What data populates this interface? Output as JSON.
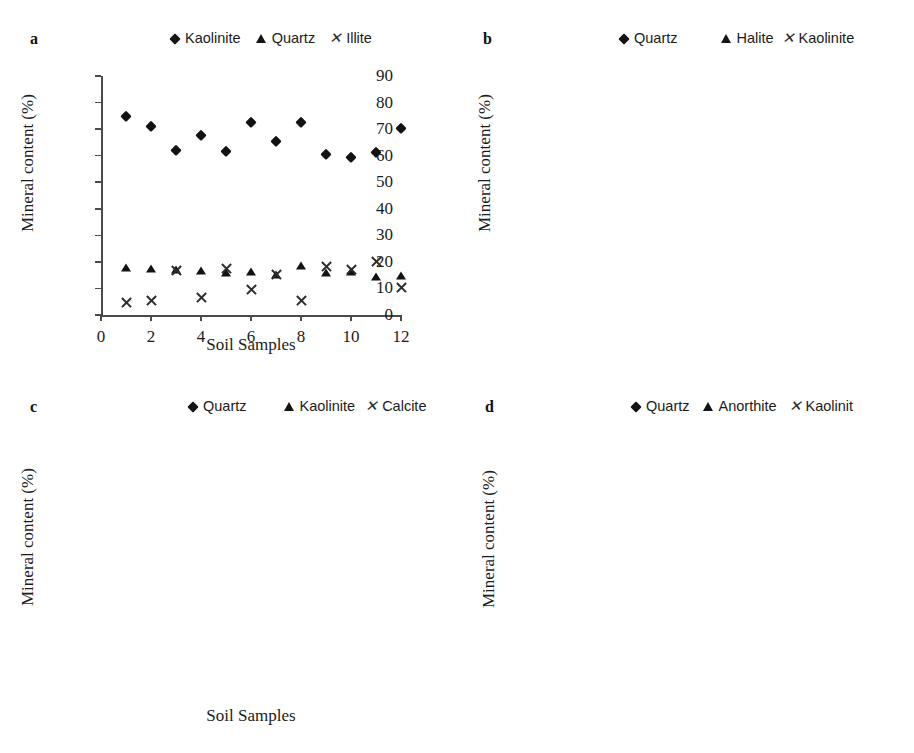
{
  "figure": {
    "axis_title_y": "Mineral content (%)",
    "axis_title_x": "Soil Samples",
    "xticks": [
      "0",
      "2",
      "4",
      "6",
      "8",
      "10",
      "12"
    ]
  },
  "panels": [
    {
      "letter": "a",
      "yticks": [
        "0",
        "10",
        "20",
        "30",
        "40",
        "50",
        "60",
        "70",
        "80",
        "90"
      ],
      "legend": [
        {
          "marker": "diamond-marker",
          "label": "Kaolinite"
        },
        {
          "marker": "triangle-marker",
          "label": "Quartz"
        },
        {
          "marker": "cross-marker",
          "label": "Illite"
        }
      ]
    },
    {
      "letter": "b",
      "yticks": [
        "0",
        "10",
        "20",
        "30",
        "40",
        "50",
        "60",
        "70",
        "80",
        "90"
      ],
      "legend": [
        {
          "marker": "diamond-marker",
          "label": "Quartz"
        },
        {
          "marker": "triangle-marker",
          "label": "Halite"
        },
        {
          "marker": "cross-marker",
          "label": "Kaolinite"
        }
      ]
    },
    {
      "letter": "c",
      "yticks": [
        "0",
        "10",
        "20",
        "30",
        "40",
        "50",
        "60",
        "70",
        "80"
      ],
      "legend": [
        {
          "marker": "diamond-marker",
          "label": "Quartz"
        },
        {
          "marker": "triangle-marker",
          "label": "Kaolinite"
        },
        {
          "marker": "cross-marker",
          "label": "Calcite"
        }
      ]
    },
    {
      "letter": "d",
      "yticks": [
        "0",
        "10",
        "20",
        "30",
        "40",
        "50",
        "60",
        "70",
        "80",
        "90",
        "100"
      ],
      "legend": [
        {
          "marker": "diamond-marker",
          "label": "Quartz"
        },
        {
          "marker": "triangle-marker",
          "label": "Anorthite"
        },
        {
          "marker": "cross-marker",
          "label": "Kaolinit"
        }
      ]
    }
  ],
  "chart_data": [
    {
      "panel": "a",
      "type": "scatter",
      "title": "",
      "xlabel": "Soil Samples",
      "ylabel": "Mineral content (%)",
      "xlim": [
        0,
        12
      ],
      "ylim": [
        0,
        90
      ],
      "ytick_step": 10,
      "xtick_step": 2,
      "grid": false,
      "legend_position": "top",
      "x": [
        1,
        2,
        3,
        4,
        5,
        6,
        7,
        8,
        9,
        10,
        11,
        12
      ],
      "series": [
        {
          "name": "Kaolinite",
          "marker": "diamond",
          "values": [
            75.0,
            71.0,
            62.0,
            67.7,
            61.8,
            72.6,
            65.7,
            72.5,
            60.5,
            59.4,
            61.4,
            70.3
          ]
        },
        {
          "name": "Quartz",
          "marker": "triangle",
          "values": [
            17.6,
            17.5,
            16.9,
            16.5,
            16.0,
            16.3,
            15.0,
            18.3,
            16.0,
            16.2,
            14.2,
            14.8
          ]
        },
        {
          "name": "Illite",
          "marker": "cross",
          "values": [
            4.8,
            5.6,
            16.8,
            6.5,
            17.4,
            9.6,
            15.2,
            5.4,
            18.2,
            17.2,
            20.3,
            10.3
          ]
        }
      ]
    },
    {
      "panel": "b",
      "type": "scatter",
      "title": "",
      "xlabel": "Soil Samples",
      "ylabel": "Mineral content (%)",
      "xlim": [
        0,
        12
      ],
      "ylim": [
        0,
        90
      ],
      "ytick_step": 10,
      "xtick_step": 2,
      "grid": false,
      "legend_position": "top",
      "x": [
        1,
        2,
        3,
        4,
        5,
        6,
        7,
        8,
        9,
        10,
        11,
        12
      ],
      "series": [
        {
          "name": "Quartz",
          "marker": "diamond",
          "values": [
            64.8,
            72.8,
            60.8,
            70.8,
            55.8,
            59.7,
            66.6,
            79.6,
            66.5,
            65.5,
            74.3,
            77.3
          ]
        },
        {
          "name": "Halite",
          "marker": "triangle",
          "values": [
            19.7,
            16.7,
            18.9,
            19.7,
            18.5,
            19.8,
            14.7,
            10.6,
            14.8,
            17.4,
            14.2,
            17.0
          ]
        },
        {
          "name": "Kaolinite",
          "marker": "cross",
          "values": [
            5.0,
            0.7,
            10.9,
            0.0,
            15.6,
            14.9,
            12.1,
            0.0,
            12.2,
            6.5,
            0.0,
            0.0
          ]
        }
      ]
    },
    {
      "panel": "c",
      "type": "scatter",
      "title": "",
      "xlabel": "Soil Samples",
      "ylabel": "Mineral content (%)",
      "xlim": [
        0,
        12
      ],
      "ylim": [
        0,
        80
      ],
      "ytick_step": 10,
      "xtick_step": 2,
      "grid": false,
      "legend_position": "top",
      "x": [
        1,
        2,
        3,
        4,
        5,
        6,
        7,
        8,
        9,
        10,
        11,
        12
      ],
      "series": [
        {
          "name": "Quartz",
          "marker": "diamond",
          "values": [
            64.8,
            68.7,
            68.6,
            65.5,
            64.4,
            65.4,
            70.5,
            68.3,
            70.2,
            57.0,
            71.9,
            69.0
          ]
        },
        {
          "name": "Kaolinite",
          "marker": "triangle",
          "values": [
            14.6,
            20.6,
            24.6,
            17.6,
            16.4,
            16.5,
            26.4,
            19.3,
            17.2,
            26.0,
            21.0,
            9.6
          ]
        },
        {
          "name": "Calcite",
          "marker": "cross",
          "values": [
            7.8,
            5.7,
            3.8,
            7.7,
            6.5,
            5.6,
            0.0,
            7.5,
            5.2,
            6.1,
            3.0,
            7.2
          ]
        }
      ]
    },
    {
      "panel": "d",
      "type": "scatter",
      "title": "",
      "xlabel": "Soil Samples",
      "ylabel": "Mineral content (%)",
      "xlim": [
        0,
        12
      ],
      "ylim": [
        0,
        100
      ],
      "ytick_step": 10,
      "xtick_step": 2,
      "grid": false,
      "legend_position": "top",
      "x": [
        1,
        2,
        3,
        4,
        5,
        6,
        7,
        8,
        9,
        10,
        11,
        12
      ],
      "series": [
        {
          "name": "Quartz",
          "marker": "diamond",
          "values": [
            74.7,
            69.0,
            65.0,
            60.8,
            72.8,
            73.7,
            67.8,
            87.5,
            68.7,
            75.4,
            54.6,
            71.6
          ]
        },
        {
          "name": "Anorthite",
          "marker": "triangle",
          "values": [
            14.6,
            27.0,
            32.8,
            36.8,
            23.9,
            22.7,
            30.5,
            7.8,
            28.5,
            22.5,
            42.2,
            25.2
          ]
        },
        {
          "name": "Kaolinit",
          "marker": "cross",
          "values": [
            5.0,
            3.8,
            1.7,
            1.3,
            2.7,
            2.7,
            1.0,
            3.6,
            1.5,
            0.0,
            1.6,
            1.3
          ]
        }
      ]
    }
  ]
}
